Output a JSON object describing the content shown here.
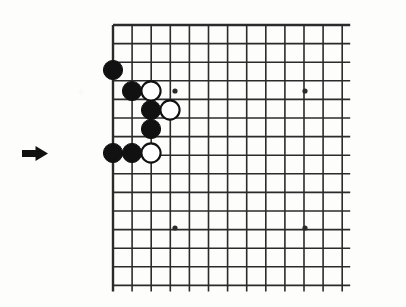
{
  "figure": {
    "kind": "go-board-diagram",
    "background_color": "#fdfdfc",
    "line_color": "#2b2b2b",
    "black_stone_color": "#111111",
    "white_stone_color": "#ffffff",
    "white_stone_border_color": "#111111"
  },
  "move_marker": {
    "name": "arrow-marker",
    "direction": "right",
    "color": "#111111",
    "position": {
      "x": 22,
      "y": 146
    },
    "width": 26,
    "height": 15
  },
  "board": {
    "origin": {
      "x": 113,
      "y": 25
    },
    "cell_width": 19.1,
    "cell_height": 18.6,
    "columns": 13,
    "rows": 15,
    "left_edge_is_board_border": true,
    "top_edge_is_board_border": true,
    "right_edge_is_cropped": true,
    "bottom_edge_is_cropped": true,
    "border_line_width": 2.4,
    "inner_line_width": 1.6,
    "overhang_right": 8,
    "overhang_bottom": 6
  },
  "star_points": [
    {
      "name": "star-point-top-left",
      "col": 3,
      "row": 3,
      "x": 175,
      "y": 91
    },
    {
      "name": "star-point-top-right",
      "col": 10,
      "row": 3,
      "x": 305,
      "y": 91
    },
    {
      "name": "star-point-bottom-left",
      "col": 3,
      "row": 11,
      "x": 175,
      "y": 228
    },
    {
      "name": "star-point-bottom-right",
      "col": 10,
      "row": 11,
      "x": 305,
      "y": 228
    }
  ],
  "star_point_radius": 2.6,
  "stone_radius": 9.6,
  "stones": [
    {
      "name": "black-stone-1",
      "color": "black",
      "col": 0,
      "row": 2,
      "x": 113,
      "y": 70
    },
    {
      "name": "black-stone-2",
      "color": "black",
      "col": 1,
      "row": 3,
      "x": 132,
      "y": 91
    },
    {
      "name": "white-stone-1",
      "color": "white",
      "col": 2,
      "row": 3,
      "x": 151,
      "y": 91
    },
    {
      "name": "black-stone-3",
      "color": "black",
      "col": 2,
      "row": 4,
      "x": 151,
      "y": 110
    },
    {
      "name": "white-stone-2",
      "color": "white",
      "col": 3,
      "row": 4,
      "x": 170,
      "y": 110
    },
    {
      "name": "black-stone-4",
      "color": "black",
      "col": 2,
      "row": 5,
      "x": 151,
      "y": 129
    },
    {
      "name": "black-stone-5",
      "color": "black",
      "col": 0,
      "row": 7,
      "x": 113,
      "y": 153
    },
    {
      "name": "black-stone-6",
      "color": "black",
      "col": 1,
      "row": 7,
      "x": 132,
      "y": 153
    },
    {
      "name": "white-stone-3",
      "color": "white",
      "col": 2,
      "row": 7,
      "x": 151,
      "y": 153
    }
  ],
  "counts": {
    "black_stones": 6,
    "white_stones": 3,
    "total_stones": 9
  }
}
